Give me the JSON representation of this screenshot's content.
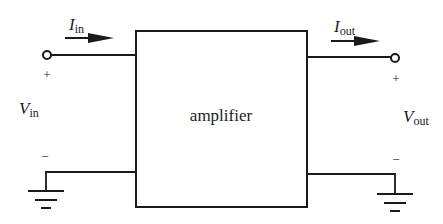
{
  "diagram": {
    "block": {
      "label": "amplifier"
    },
    "input": {
      "current_label": {
        "main": "I",
        "sub": "in"
      },
      "voltage_label": {
        "main": "V",
        "sub": "in"
      },
      "plus": "+",
      "minus": "−"
    },
    "output": {
      "current_label": {
        "main": "I",
        "sub": "out"
      },
      "voltage_label": {
        "main": "V",
        "sub": "out"
      },
      "plus": "+",
      "minus": "−"
    },
    "colors": {
      "stroke": "#1a1a1a",
      "text": "#222222",
      "background": "#ffffff"
    }
  }
}
